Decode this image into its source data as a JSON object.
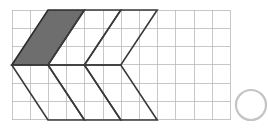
{
  "canvas": {
    "width": 268,
    "height": 132,
    "background": "#ffffff"
  },
  "colors": {
    "grid_line": "#b9b9b9",
    "shape_outline": "#3a3a3a",
    "shaded_fill": "#6e6e6e",
    "shaded_outline": "#2b2b2b",
    "bubble_outline": "#c4c4c4",
    "bubble_fill": "#ffffff"
  },
  "grid": {
    "name": "square-grid",
    "origin_x": 12,
    "origin_y": 10,
    "columns": 12,
    "rows": 6,
    "cell_width": 18.2,
    "cell_height": 18.3,
    "stroke_width": 0.8,
    "visible": true
  },
  "figure": {
    "name": "chevron-zigzag-arrow",
    "stroke_width": 1.6,
    "upper_band": {
      "name": "upper-parallelogram-row",
      "slant": "up-right",
      "segments": [
        {
          "name": "shaded-parallelogram",
          "shaded": true,
          "points": "48,10 84.4,10 48,65 11.8,65"
        },
        {
          "name": "open-parallelogram-2",
          "shaded": false,
          "points": "84.4,10 120.8,10 84.4,65 48,65"
        },
        {
          "name": "open-parallelogram-3",
          "shaded": false,
          "points": "120.8,10 157.2,10 120.8,65 84.4,65"
        }
      ]
    },
    "lower_band": {
      "name": "lower-parallelogram-row",
      "slant": "down-right",
      "segments": [
        {
          "name": "lower-parallelogram-1",
          "shaded": false,
          "points": "11.8,65 48,65 84.4,120 48,120"
        },
        {
          "name": "lower-parallelogram-2",
          "shaded": false,
          "points": "48,65 84.4,65 120.8,120 84.4,120"
        },
        {
          "name": "lower-parallelogram-3",
          "shaded": false,
          "points": "84.4,65 120.8,65 157.2,120 120.8,120"
        }
      ]
    }
  },
  "answer_bubble": {
    "name": "answer-bubble",
    "center_x": 251,
    "center_y": 105,
    "radius": 15,
    "stroke_width": 2.2,
    "selected": false,
    "label": ""
  }
}
